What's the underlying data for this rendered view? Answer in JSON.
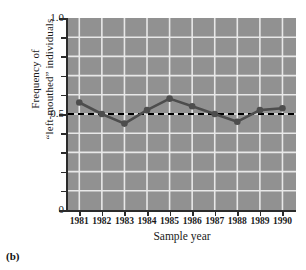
{
  "figure": {
    "caption": "(b)"
  },
  "axes": {
    "ylabel_line1": "Frequency of",
    "ylabel_line2": "“left-mouthed” individuals",
    "xlabel": "Sample year",
    "ytick_labels": [
      "1.0",
      "0.5",
      "0"
    ],
    "xtick_labels": [
      "1981",
      "1982",
      "1983",
      "1984",
      "1985",
      "1986",
      "1987",
      "1988",
      "1989",
      "1990"
    ]
  },
  "style": {
    "plot_background": "#919191",
    "gridline_color": "#e8e8e8",
    "series_color": "#4d4d4d",
    "reference_line_color": "#000000",
    "axis_color": "#2b2b2b",
    "text_color": "#1a1a1a",
    "page_background": "#ffffff"
  },
  "chart_data": {
    "type": "line",
    "title": "",
    "xlabel": "Sample year",
    "ylabel": "Frequency of “left-mouthed” individuals",
    "x": [
      1981,
      1982,
      1983,
      1984,
      1985,
      1986,
      1987,
      1988,
      1989,
      1990
    ],
    "categories": [
      "1981",
      "1982",
      "1983",
      "1984",
      "1985",
      "1986",
      "1987",
      "1988",
      "1989",
      "1990"
    ],
    "values": [
      0.56,
      0.5,
      0.45,
      0.52,
      0.58,
      0.54,
      0.5,
      0.46,
      0.52,
      0.53
    ],
    "series": [
      {
        "name": "Frequency of “left-mouthed” individuals",
        "values": [
          0.56,
          0.5,
          0.45,
          0.52,
          0.58,
          0.54,
          0.5,
          0.46,
          0.52,
          0.53
        ],
        "marker": "circle",
        "color": "#4d4d4d"
      }
    ],
    "reference_lines": [
      {
        "orientation": "horizontal",
        "value": 0.5,
        "style": "dashed",
        "color": "#000000"
      }
    ],
    "xlim": [
      1980.5,
      1990.6
    ],
    "ylim": [
      0,
      1.0
    ],
    "ytick_values": [
      0,
      0.5,
      1.0
    ],
    "yminor_tick_values": [
      0.1,
      0.2,
      0.3,
      0.4,
      0.6,
      0.7,
      0.8,
      0.9
    ],
    "grid": true,
    "grid_axis": "both",
    "legend": false,
    "legend_position": "none"
  }
}
